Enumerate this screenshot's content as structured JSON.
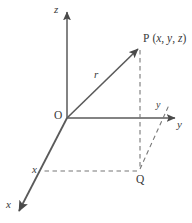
{
  "figure": {
    "type": "3d-cartesian-coordinate-diagram",
    "background_color": "#ffffff",
    "stroke_color": "#4a4a4a",
    "dash_color": "#6e6e6e",
    "text_color": "#3a3a3a",
    "width": 192,
    "height": 223,
    "labels": {
      "origin": "O",
      "z_axis": "z",
      "y_axis": "y",
      "y_projection": "y",
      "x_axis": "x",
      "x_projection": "x",
      "vector": "r",
      "point_p_name": "P",
      "point_p_coords_open": "(",
      "point_p_x": "x",
      "point_p_sep1": ", ",
      "point_p_y": "y",
      "point_p_sep2": ", ",
      "point_p_z": "z",
      "point_p_coords_close": ")",
      "point_q": "Q"
    },
    "geometry": {
      "origin": [
        67,
        118
      ],
      "z_axis_tip": [
        67,
        10
      ],
      "y_axis_tip": [
        177,
        118
      ],
      "x_axis_tip": [
        17,
        213
      ],
      "point_p": [
        140,
        47
      ],
      "point_q": [
        140,
        172
      ],
      "x_foot": [
        42,
        171
      ],
      "y_foot": [
        168,
        108
      ]
    }
  }
}
